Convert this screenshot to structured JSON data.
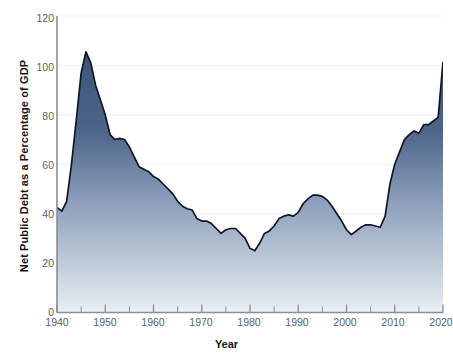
{
  "chart_data": {
    "type": "area",
    "title": "",
    "xlabel": "Year",
    "ylabel": "Net Public Debt as a Percentage of GDP",
    "xlim": [
      1940,
      2020
    ],
    "ylim": [
      0,
      120
    ],
    "yticks": [
      0,
      20,
      40,
      60,
      80,
      100,
      120
    ],
    "xticks": [
      1940,
      1950,
      1960,
      1970,
      1980,
      1990,
      2000,
      2010,
      2020
    ],
    "x_minor_tick_step": 5,
    "grid": "horizontal-light",
    "legend": "none",
    "series_name": "Net Public Debt as a Percentage of GDP",
    "fill_color_top": "#3c5578",
    "fill_color_bottom": "#e9eff3",
    "line_color": "#111625",
    "axis_color": "#8a8f96",
    "tick_label_color": "#5a5f66",
    "x": [
      1940,
      1941,
      1942,
      1943,
      1944,
      1945,
      1946,
      1947,
      1948,
      1949,
      1950,
      1951,
      1952,
      1953,
      1954,
      1955,
      1956,
      1957,
      1958,
      1959,
      1960,
      1961,
      1962,
      1963,
      1964,
      1965,
      1966,
      1967,
      1968,
      1969,
      1970,
      1971,
      1972,
      1973,
      1974,
      1975,
      1976,
      1977,
      1978,
      1979,
      1980,
      1981,
      1982,
      1983,
      1984,
      1985,
      1986,
      1987,
      1988,
      1989,
      1990,
      1991,
      1992,
      1993,
      1994,
      1995,
      1996,
      1997,
      1998,
      1999,
      2000,
      2001,
      2002,
      2003,
      2004,
      2005,
      2006,
      2007,
      2008,
      2009,
      2010,
      2011,
      2012,
      2013,
      2014,
      2015,
      2016,
      2017,
      2018,
      2019,
      2020
    ],
    "values": [
      42.5,
      41.0,
      45.0,
      60.0,
      78.0,
      97.0,
      105.5,
      101.0,
      92.0,
      86.0,
      80.0,
      72.0,
      70.0,
      70.5,
      70.0,
      67.0,
      63.0,
      59.0,
      58.0,
      57.0,
      55.0,
      54.0,
      52.0,
      50.0,
      48.0,
      45.0,
      43.0,
      42.0,
      41.5,
      38.0,
      37.0,
      37.0,
      36.0,
      34.0,
      32.0,
      33.5,
      34.0,
      34.0,
      32.0,
      30.0,
      26.0,
      25.0,
      28.0,
      32.0,
      33.0,
      35.0,
      38.0,
      39.0,
      39.5,
      39.0,
      40.5,
      44.0,
      46.0,
      47.5,
      47.5,
      47.0,
      45.5,
      43.0,
      40.0,
      37.0,
      33.5,
      31.5,
      33.0,
      34.5,
      35.5,
      35.5,
      35.0,
      34.5,
      39.0,
      52.0,
      60.0,
      65.0,
      70.0,
      72.0,
      73.5,
      72.5,
      76.0,
      76.0,
      77.5,
      79.0,
      101.5
    ]
  }
}
